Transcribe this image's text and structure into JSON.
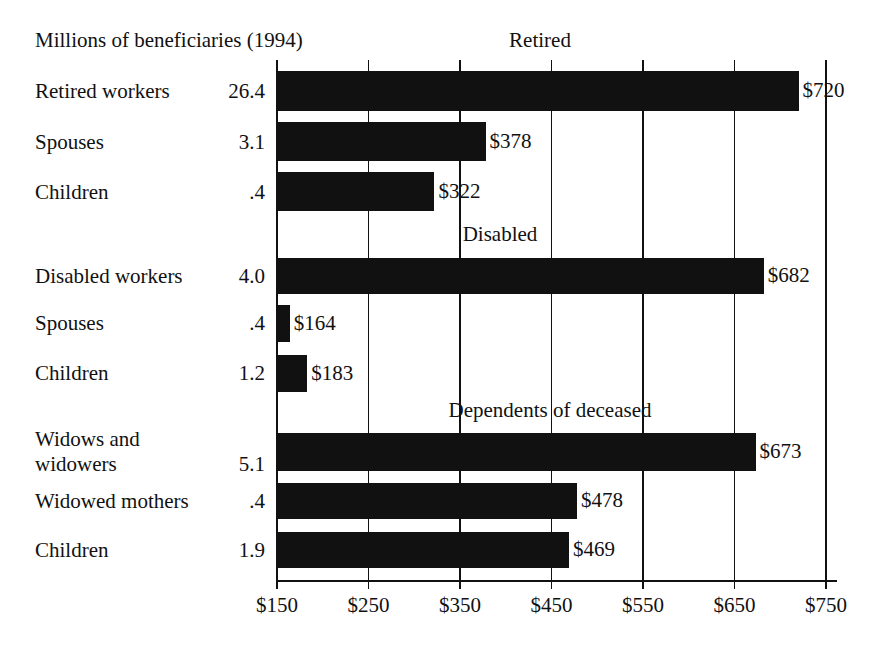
{
  "chart_data": {
    "type": "bar",
    "orientation": "horizontal",
    "title": "Millions of beneficiaries (1994)",
    "xlabel": "",
    "ylabel": "",
    "xlim": [
      150,
      750
    ],
    "xticks": [
      150,
      250,
      350,
      450,
      550,
      650,
      750
    ],
    "xtick_labels": [
      "$150",
      "$250",
      "$350",
      "$450",
      "$550",
      "$650",
      "$750"
    ],
    "grid": true,
    "legend": "none",
    "bar_color": "#111111",
    "groups": [
      {
        "header": "Retired",
        "rows": [
          {
            "label": "Retired workers",
            "beneficiaries": "26.4",
            "value": 720,
            "value_label": "$720"
          },
          {
            "label": "Spouses",
            "beneficiaries": "3.1",
            "value": 378,
            "value_label": "$378"
          },
          {
            "label": "Children",
            "beneficiaries": ".4",
            "value": 322,
            "value_label": "$322"
          }
        ]
      },
      {
        "header": "Disabled",
        "rows": [
          {
            "label": "Disabled workers",
            "beneficiaries": "4.0",
            "value": 682,
            "value_label": "$682"
          },
          {
            "label": "Spouses",
            "beneficiaries": ".4",
            "value": 164,
            "value_label": "$164"
          },
          {
            "label": "Children",
            "beneficiaries": "1.2",
            "value": 183,
            "value_label": "$183"
          }
        ]
      },
      {
        "header": "Dependents of deceased",
        "rows": [
          {
            "label": "Widows and\nwidowers",
            "beneficiaries": "5.1",
            "value": 673,
            "value_label": "$673"
          },
          {
            "label": "Widowed mothers",
            "beneficiaries": ".4",
            "value": 478,
            "value_label": "$478"
          },
          {
            "label": "Children",
            "beneficiaries": "1.9",
            "value": 469,
            "value_label": "$469"
          }
        ]
      }
    ]
  },
  "layout": {
    "plot_left": 277,
    "plot_right": 826,
    "baseline_y": 580,
    "group_header_x": [
      540,
      500,
      550
    ],
    "group_header_y": [
      28,
      222,
      398
    ],
    "rows_geometry": [
      {
        "bar_top": 71,
        "bar_height": 40,
        "label_top": 79,
        "label_lines": 1
      },
      {
        "bar_top": 122,
        "bar_height": 39,
        "label_top": 130,
        "label_lines": 1
      },
      {
        "bar_top": 172,
        "bar_height": 39,
        "label_top": 180,
        "label_lines": 1
      },
      {
        "bar_top": 258,
        "bar_height": 36,
        "label_top": 264,
        "label_lines": 1
      },
      {
        "bar_top": 305,
        "bar_height": 37,
        "label_top": 311,
        "label_lines": 1
      },
      {
        "bar_top": 355,
        "bar_height": 37,
        "label_top": 361,
        "label_lines": 1
      },
      {
        "bar_top": 433,
        "bar_height": 38,
        "label_top": 427,
        "label_lines": 2
      },
      {
        "bar_top": 483,
        "bar_height": 36,
        "label_top": 489,
        "label_lines": 1
      },
      {
        "bar_top": 532,
        "bar_height": 36,
        "label_top": 538,
        "label_lines": 1
      }
    ]
  }
}
